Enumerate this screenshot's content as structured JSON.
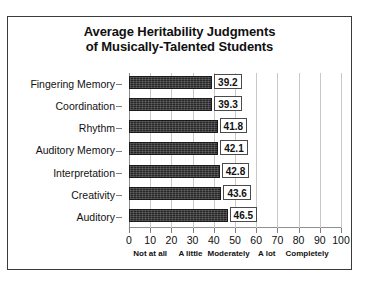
{
  "figure": {
    "title_lines": [
      "Average Heritability Judgments",
      "of Musically-Talented Students"
    ]
  },
  "chart_data": {
    "type": "bar",
    "orientation": "horizontal",
    "title": "Average Heritability Judgments of Musically-Talented Students",
    "xlabel": "",
    "ylabel": "",
    "xlim": [
      0,
      100
    ],
    "xticks": [
      0,
      10,
      20,
      30,
      40,
      50,
      60,
      70,
      80,
      90,
      100
    ],
    "xtick_labels": [
      "0",
      "10",
      "20",
      "30",
      "40",
      "50",
      "60",
      "70",
      "80",
      "90",
      "100"
    ],
    "grid": true,
    "grid_axis": "x",
    "legend": "none",
    "bar_color": "#272727",
    "categories": [
      "Fingering Memory",
      "Coordination",
      "Rhythm",
      "Auditory Memory",
      "Interpretation",
      "Creativity",
      "Auditory"
    ],
    "values": [
      39.2,
      39.3,
      41.8,
      42.1,
      42.8,
      43.6,
      46.5
    ],
    "value_labels": [
      "39.2",
      "39.3",
      "41.8",
      "42.1",
      "42.8",
      "43.6",
      "46.5"
    ],
    "scale_anchors": [
      {
        "label": "Not at all",
        "position": 10
      },
      {
        "label": "A little",
        "position": 29
      },
      {
        "label": "Moderately",
        "position": 47
      },
      {
        "label": "A lot",
        "position": 65
      },
      {
        "label": "Completely",
        "position": 84
      }
    ]
  }
}
